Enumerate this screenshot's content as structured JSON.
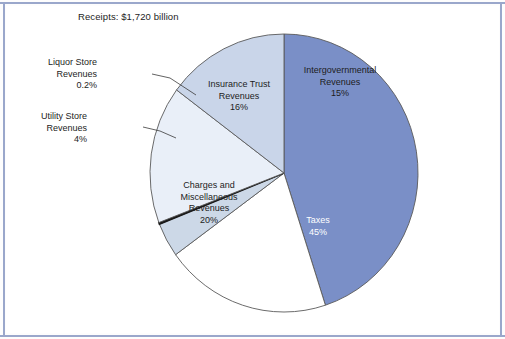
{
  "figure": {
    "title": "Receipts: $1,720 billion"
  },
  "chart_data": {
    "type": "pie",
    "title": "Receipts: $1,720 billion",
    "xlabel": "",
    "ylabel": "",
    "total_label": "$1,720 billion",
    "units": "percent of total receipts",
    "legend_position": "none",
    "grid": false,
    "categories": [
      "Taxes",
      "Charges and Miscellaneous Revenues",
      "Insurance Trust Revenues",
      "Intergovernmental Revenues",
      "Utility Store Revenues",
      "Liquor Store Revenues"
    ],
    "values": [
      45,
      20,
      16,
      15,
      4,
      0.2
    ],
    "slices": [
      {
        "name": "Taxes",
        "label_lines": [
          "Taxes",
          "45%"
        ],
        "value": 45,
        "value_text": "45%",
        "color": "#7a8fc7",
        "start_deg": 0,
        "end_deg": 162,
        "label_style": "inside-light",
        "label_x": 318,
        "label_y": 215
      },
      {
        "name": "Charges and Miscellaneous Revenues",
        "label_lines": [
          "Charges and",
          "Miscellaneous",
          "Revenues",
          "20%"
        ],
        "value": 20,
        "value_text": "20%",
        "color": "#ffffff",
        "start_deg": 162,
        "end_deg": 234,
        "label_style": "inside-dark",
        "label_x": 209,
        "label_y": 180
      },
      {
        "name": "Utility Store Revenues",
        "label_lines": [
          "Utility Store",
          "Revenues",
          "4%"
        ],
        "value": 4,
        "value_text": "4%",
        "color": "#ccd8e7",
        "start_deg": 234,
        "end_deg": 248.4,
        "label_style": "callout",
        "label_x": 87,
        "label_y": 111
      },
      {
        "name": "Liquor Store Revenues",
        "label_lines": [
          "Liquor Store",
          "Revenues",
          "0.2%"
        ],
        "value": 0.2,
        "value_text": "0.2%",
        "color": "#1a1a1a",
        "start_deg": 248.4,
        "end_deg": 249.1,
        "label_style": "callout",
        "label_x": 97,
        "label_y": 57
      },
      {
        "name": "Insurance Trust Revenues",
        "label_lines": [
          "Insurance Trust",
          "Revenues",
          "16%"
        ],
        "value": 16,
        "value_text": "16%",
        "color": "#e9eff8",
        "start_deg": 249.1,
        "end_deg": 306.7,
        "label_style": "inside-dark",
        "label_x": 239,
        "label_y": 79
      },
      {
        "name": "Intergovernmental Revenues",
        "label_lines": [
          "Intergovernmental",
          "Revenues",
          "15%"
        ],
        "value": 15,
        "value_text": "15%",
        "color": "#c9d5e9",
        "start_deg": 306.7,
        "end_deg": 360,
        "label_style": "inside-dark",
        "label_x": 340,
        "label_y": 65
      }
    ],
    "geometry": {
      "center_x": 284,
      "center_y": 173,
      "radius_x": 134,
      "radius_y": 139
    },
    "colors": {
      "taxes": "#7a8fc7",
      "charges": "#ffffff",
      "utility": "#ccd8e7",
      "liquor": "#1a1a1a",
      "insurance": "#e9eff8",
      "intergovernmental": "#c9d5e9",
      "outline": "#5a5a5a",
      "frame": "#9aa7cb"
    }
  },
  "labels": {
    "taxes": {
      "l1": "Taxes",
      "l2": "45%"
    },
    "charges": {
      "l1": "Charges and",
      "l2": "Miscellaneous",
      "l3": "Revenues",
      "l4": "20%"
    },
    "utility": {
      "l1": "Utility Store",
      "l2": "Revenues",
      "l3": "4%"
    },
    "liquor": {
      "l1": "Liquor Store",
      "l2": "Revenues",
      "l3": "0.2%"
    },
    "insurance": {
      "l1": "Insurance Trust",
      "l2": "Revenues",
      "l3": "16%"
    },
    "intergovernmental": {
      "l1": "Intergovernmental",
      "l2": "Revenues",
      "l3": "15%"
    }
  }
}
